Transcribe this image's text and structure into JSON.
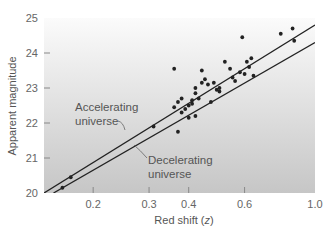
{
  "chart_data": {
    "type": "scatter",
    "title": "",
    "xlabel": "Red shift (z)",
    "ylabel": "Apparent magnitude",
    "x_scale": "log",
    "xlim": [
      0.14,
      1.0
    ],
    "ylim": [
      20,
      25
    ],
    "x_ticks": [
      0.2,
      0.3,
      0.4,
      0.6,
      1.0
    ],
    "x_tick_labels": [
      "0.2",
      "0.3",
      "0.4",
      "0.6",
      "1.0"
    ],
    "y_ticks": [
      20,
      21,
      22,
      23,
      24,
      25
    ],
    "y_tick_labels": [
      "20",
      "21",
      "22",
      "23",
      "24",
      "25"
    ],
    "grid": false,
    "background": "vertical gradient, white (top) to light gray (bottom)",
    "series": [
      {
        "name": "Accelerating universe",
        "kind": "line",
        "points": [
          [
            0.14,
            20.0
          ],
          [
            1.0,
            24.8
          ]
        ]
      },
      {
        "name": "Decelerating universe",
        "kind": "line",
        "points": [
          [
            0.15,
            20.0
          ],
          [
            1.0,
            24.3
          ]
        ]
      },
      {
        "name": "Supernovae observations",
        "kind": "scatter",
        "points": [
          [
            0.17,
            20.45
          ],
          [
            0.16,
            20.15
          ],
          [
            0.31,
            21.9
          ],
          [
            0.36,
            22.45
          ],
          [
            0.37,
            22.6
          ],
          [
            0.38,
            22.7
          ],
          [
            0.37,
            21.75
          ],
          [
            0.36,
            23.55
          ],
          [
            0.38,
            22.3
          ],
          [
            0.39,
            22.4
          ],
          [
            0.4,
            22.5
          ],
          [
            0.41,
            22.55
          ],
          [
            0.41,
            22.65
          ],
          [
            0.4,
            22.15
          ],
          [
            0.42,
            22.2
          ],
          [
            0.42,
            22.85
          ],
          [
            0.43,
            22.7
          ],
          [
            0.42,
            23.0
          ],
          [
            0.44,
            23.15
          ],
          [
            0.45,
            23.25
          ],
          [
            0.46,
            23.1
          ],
          [
            0.44,
            23.5
          ],
          [
            0.47,
            22.6
          ],
          [
            0.48,
            23.15
          ],
          [
            0.49,
            22.95
          ],
          [
            0.5,
            23.0
          ],
          [
            0.52,
            23.75
          ],
          [
            0.5,
            22.9
          ],
          [
            0.54,
            23.55
          ],
          [
            0.55,
            23.3
          ],
          [
            0.56,
            23.2
          ],
          [
            0.58,
            23.45
          ],
          [
            0.59,
            24.45
          ],
          [
            0.6,
            23.4
          ],
          [
            0.61,
            23.75
          ],
          [
            0.63,
            23.85
          ],
          [
            0.64,
            23.35
          ],
          [
            0.62,
            23.6
          ],
          [
            0.78,
            24.55
          ],
          [
            0.85,
            24.7
          ],
          [
            0.86,
            24.35
          ]
        ]
      }
    ],
    "annotations": [
      {
        "text": [
          "Accelerating",
          "universe"
        ],
        "points_to": "Accelerating universe line"
      },
      {
        "text": [
          "Decelerating",
          "universe"
        ],
        "points_to": "Decelerating universe line"
      }
    ]
  },
  "labels": {
    "ylabel": "Apparent magnitude",
    "xlabel_main": "Red shift (",
    "xlabel_var": "z",
    "xlabel_close": ")",
    "acc_line1": "Accelerating",
    "acc_line2": "universe",
    "dec_line1": "Decelerating",
    "dec_line2": "universe"
  },
  "colors": {
    "gradient_top": "#fbfbfb",
    "gradient_bottom": "#c9c9c9",
    "line": "#222222",
    "point": "#222222",
    "axis_text": "#666666"
  }
}
